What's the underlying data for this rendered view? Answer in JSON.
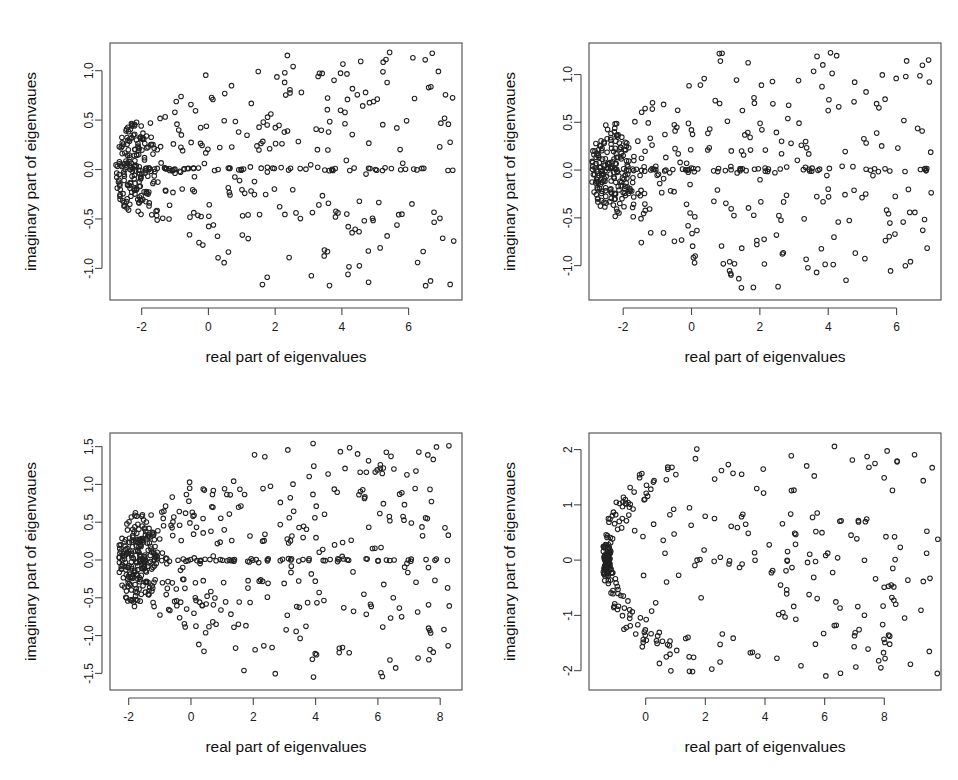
{
  "figure": {
    "title": "",
    "background_color": "#ffffff",
    "panel_count": 4,
    "layout": "2x2 grid of scatter plots",
    "marker": {
      "shape": "open-circle",
      "radius_px": 2.3,
      "stroke_color": "#222222",
      "fill": "none"
    }
  },
  "chart_data": [
    {
      "id": "panel-1",
      "position": "top-left",
      "type": "scatter",
      "title": "",
      "xlabel": "real part of eigenvalues",
      "ylabel": "imaginary part of eigenvaues",
      "xticks": [
        -2,
        0,
        2,
        4,
        6
      ],
      "xticklabels": [
        "-2",
        "0",
        "2",
        "4",
        "6"
      ],
      "yticks": [
        -1.0,
        -0.5,
        0.0,
        0.5,
        1.0
      ],
      "yticklabels": [
        "-1.0",
        "-0.5",
        "0.0",
        "0.5",
        "1.0"
      ],
      "xlim": [
        -2.95,
        7.6
      ],
      "ylim": [
        -1.32,
        1.28
      ],
      "grid": false,
      "legend": "none",
      "n_points": 460,
      "shape_description": "teardrop / parabolic cloud of eigenvalues, dense dark cluster near real part -2.3, spreading rightward; prominent horizontal line of real eigenvalues at imaginary part 0.0",
      "cluster_x": -2.35,
      "spread_max_x": 7.3,
      "max_abs_imag": 1.15,
      "real_axis_line_points": 58,
      "seed": 11
    },
    {
      "id": "panel-2",
      "position": "top-right",
      "type": "scatter",
      "title": "",
      "xlabel": "real part of eigenvalues",
      "ylabel": "imaginary part of eigenvaues",
      "xticks": [
        -2,
        0,
        2,
        4,
        6
      ],
      "xticklabels": [
        "-2",
        "0",
        "2",
        "4",
        "6"
      ],
      "yticks": [
        -1.0,
        -0.5,
        0.0,
        0.5,
        1.0
      ],
      "yticklabels": [
        "-1.0",
        "-0.5",
        "0.0",
        "0.5",
        "1.0"
      ],
      "xlim": [
        -3.0,
        7.3
      ],
      "ylim": [
        -1.36,
        1.33
      ],
      "grid": false,
      "legend": "none",
      "n_points": 470,
      "shape_description": "teardrop cloud with dense dark vertex near real part -2.5, radial filament streaks fanning right; horizontal real-axis line of eigenvalues at 0.0",
      "cluster_x": -2.5,
      "spread_max_x": 6.9,
      "max_abs_imag": 1.2,
      "real_axis_line_points": 52,
      "seed": 23
    },
    {
      "id": "panel-3",
      "position": "bottom-left",
      "type": "scatter",
      "title": "",
      "xlabel": "real part of eigenvalues",
      "ylabel": "imaginary part of eigenvaues",
      "xticks": [
        -2,
        0,
        2,
        4,
        6,
        8
      ],
      "xticklabels": [
        "-2",
        "0",
        "2",
        "4",
        "6",
        "8"
      ],
      "yticks": [
        -1.5,
        -1.0,
        -0.5,
        0.0,
        0.5,
        1.0,
        1.5
      ],
      "yticklabels": [
        "-1.5",
        "-1.0",
        "-0.5",
        "0.0",
        "0.5",
        "1.0",
        "1.5"
      ],
      "xlim": [
        -2.6,
        8.7
      ],
      "ylim": [
        -1.72,
        1.68
      ],
      "grid": false,
      "legend": "none",
      "n_points": 560,
      "shape_description": "broad parabolic cloud, very dense black cluster at left near real part -1.9, wide fan to the right reaching 8; dense horizontal real-axis line at 0.0",
      "cluster_x": -1.9,
      "spread_max_x": 8.2,
      "max_abs_imag": 1.5,
      "real_axis_line_points": 64,
      "seed": 37
    },
    {
      "id": "panel-4",
      "position": "bottom-right",
      "type": "scatter",
      "title": "",
      "xlabel": "real part of eigenvalues",
      "ylabel": "imaginary part of eigenvaues",
      "xticks": [
        0,
        2,
        4,
        6,
        8
      ],
      "xticklabels": [
        "0",
        "2",
        "4",
        "6",
        "8"
      ],
      "yticks": [
        -2,
        -1,
        0,
        1,
        2
      ],
      "yticklabels": [
        "-2",
        "-1",
        "0",
        "1",
        "2"
      ],
      "xlim": [
        -1.9,
        9.9
      ],
      "ylim": [
        -2.35,
        2.3
      ],
      "grid": false,
      "legend": "none",
      "n_points": 330,
      "shape_description": "sharp parabolic boundary outlined by densely packed points with a very dark cluster at the left vertex near real part -1.3; sparse scattered interior points spreading right to 9.5",
      "cluster_x": -1.3,
      "spread_max_x": 9.5,
      "max_abs_imag": 2.1,
      "boundary_points": 165,
      "interior_points": 165,
      "seed": 53
    }
  ]
}
